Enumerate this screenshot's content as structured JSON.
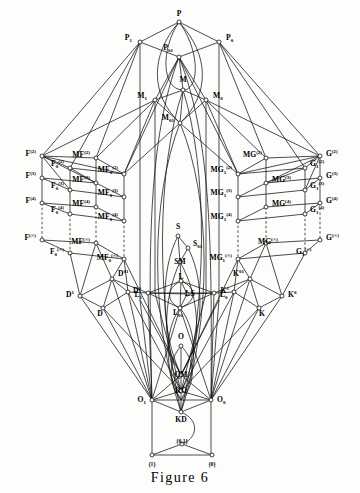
{
  "figure": {
    "caption": "Figure 6",
    "type": "lattice-hasse-diagram",
    "title": "Figure 6"
  },
  "colors": {
    "ink": "#111111",
    "paper": "#fdfdfc"
  },
  "nodes": {
    "top": [
      {
        "id": "P",
        "label": "P",
        "sub": "",
        "sup": "",
        "x": 179,
        "y": 22,
        "lx": 179,
        "ly": 16,
        "anchor": "middle"
      },
      {
        "id": "P1",
        "label": "P",
        "sub": "1",
        "sup": "",
        "x": 140,
        "y": 42,
        "lx": 132,
        "ly": 40,
        "anchor": "end"
      },
      {
        "id": "P0",
        "label": "P",
        "sub": "0",
        "sup": "",
        "x": 219,
        "y": 42,
        "lx": 226,
        "ly": 40,
        "anchor": "start"
      },
      {
        "id": "P01",
        "label": "P",
        "sub": "01",
        "sup": "",
        "x": 179,
        "y": 57,
        "lx": 173,
        "ly": 50,
        "anchor": "end"
      },
      {
        "id": "M",
        "label": "M",
        "sub": "",
        "sup": "",
        "x": 183,
        "y": 90,
        "lx": 183,
        "ly": 82,
        "anchor": "middle"
      },
      {
        "id": "M1",
        "label": "M",
        "sub": "1",
        "sup": "",
        "x": 155,
        "y": 100,
        "lx": 147,
        "ly": 98,
        "anchor": "end"
      },
      {
        "id": "M0",
        "label": "M",
        "sub": "0",
        "sup": "",
        "x": 206,
        "y": 100,
        "lx": 213,
        "ly": 98,
        "anchor": "start"
      },
      {
        "id": "M01",
        "label": "M",
        "sub": "01",
        "sup": "",
        "x": 180,
        "y": 123,
        "lx": 174,
        "ly": 120,
        "anchor": "end"
      }
    ],
    "left_F": [
      {
        "id": "F2",
        "label": "F",
        "sub": "",
        "sup": "(2)",
        "x": 42,
        "y": 156,
        "lx": 36,
        "ly": 156,
        "anchor": "end"
      },
      {
        "id": "F3",
        "label": "F",
        "sub": "",
        "sup": "(3)",
        "x": 42,
        "y": 178,
        "lx": 36,
        "ly": 178,
        "anchor": "end"
      },
      {
        "id": "F4",
        "label": "F",
        "sub": "",
        "sup": "(4)",
        "x": 42,
        "y": 203,
        "lx": 36,
        "ly": 203,
        "anchor": "end"
      },
      {
        "id": "Finf",
        "label": "F",
        "sub": "",
        "sup": "(∞)",
        "x": 42,
        "y": 240,
        "lx": 36,
        "ly": 240,
        "anchor": "end"
      },
      {
        "id": "F02",
        "label": "F",
        "sub": "0",
        "sup": "(2)",
        "x": 70,
        "y": 168,
        "lx": 64,
        "ly": 166,
        "anchor": "end"
      },
      {
        "id": "F03",
        "label": "F",
        "sub": "0",
        "sup": "(3)",
        "x": 70,
        "y": 190,
        "lx": 64,
        "ly": 188,
        "anchor": "end"
      },
      {
        "id": "F04",
        "label": "F",
        "sub": "0",
        "sup": "(4)",
        "x": 70,
        "y": 214,
        "lx": 64,
        "ly": 212,
        "anchor": "end"
      },
      {
        "id": "F0inf",
        "label": "F",
        "sub": "0",
        "sup": "(∞)",
        "x": 70,
        "y": 253,
        "lx": 64,
        "ly": 254,
        "anchor": "end"
      }
    ],
    "left_MF": [
      {
        "id": "MF2",
        "label": "MF",
        "sub": "",
        "sup": "(2)",
        "x": 96,
        "y": 158,
        "lx": 90,
        "ly": 157,
        "anchor": "end"
      },
      {
        "id": "MF3",
        "label": "MF",
        "sub": "",
        "sup": "(3)",
        "x": 96,
        "y": 183,
        "lx": 90,
        "ly": 182,
        "anchor": "end"
      },
      {
        "id": "MF4",
        "label": "MF",
        "sub": "",
        "sup": "(4)",
        "x": 96,
        "y": 207,
        "lx": 90,
        "ly": 206,
        "anchor": "end"
      },
      {
        "id": "MFinf",
        "label": "MF",
        "sub": "",
        "sup": "(∞)",
        "x": 96,
        "y": 243,
        "lx": 90,
        "ly": 244,
        "anchor": "end"
      },
      {
        "id": "MF02",
        "label": "MF",
        "sub": "0",
        "sup": "(2)",
        "x": 124,
        "y": 174,
        "lx": 118,
        "ly": 172,
        "anchor": "end"
      },
      {
        "id": "MF03",
        "label": "MF",
        "sub": "0",
        "sup": "(3)",
        "x": 124,
        "y": 197,
        "lx": 118,
        "ly": 195,
        "anchor": "end"
      },
      {
        "id": "MF04",
        "label": "MF",
        "sub": "0",
        "sup": "(4)",
        "x": 124,
        "y": 221,
        "lx": 118,
        "ly": 219,
        "anchor": "end"
      },
      {
        "id": "MF0inf",
        "label": "MF",
        "sub": "0",
        "sup": "(∞)",
        "x": 124,
        "y": 259,
        "lx": 118,
        "ly": 260,
        "anchor": "end"
      }
    ],
    "right_G": [
      {
        "id": "G2",
        "label": "G",
        "sub": "",
        "sup": "(2)",
        "x": 320,
        "y": 156,
        "lx": 326,
        "ly": 156,
        "anchor": "start"
      },
      {
        "id": "G3",
        "label": "G",
        "sub": "",
        "sup": "(3)",
        "x": 320,
        "y": 178,
        "lx": 326,
        "ly": 178,
        "anchor": "start"
      },
      {
        "id": "G4",
        "label": "G",
        "sub": "",
        "sup": "(4)",
        "x": 320,
        "y": 203,
        "lx": 326,
        "ly": 203,
        "anchor": "start"
      },
      {
        "id": "Ginf",
        "label": "G",
        "sub": "",
        "sup": "(∞)",
        "x": 320,
        "y": 240,
        "lx": 326,
        "ly": 240,
        "anchor": "start"
      },
      {
        "id": "G12",
        "label": "G",
        "sub": "1",
        "sup": "(2)",
        "x": 305,
        "y": 168,
        "lx": 310,
        "ly": 166,
        "anchor": "start"
      },
      {
        "id": "G13",
        "label": "G",
        "sub": "1",
        "sup": "(3)",
        "x": 305,
        "y": 190,
        "lx": 310,
        "ly": 188,
        "anchor": "start"
      },
      {
        "id": "G14",
        "label": "G",
        "sub": "1",
        "sup": "(4)",
        "x": 305,
        "y": 214,
        "lx": 310,
        "ly": 212,
        "anchor": "start"
      },
      {
        "id": "G1inf",
        "label": "G",
        "sub": "1",
        "sup": "(∞)",
        "x": 305,
        "y": 253,
        "lx": 296,
        "ly": 254,
        "anchor": "start"
      }
    ],
    "right_MG": [
      {
        "id": "MG2",
        "label": "MG",
        "sub": "",
        "sup": "(2)",
        "x": 266,
        "y": 158,
        "lx": 262,
        "ly": 157,
        "anchor": "end"
      },
      {
        "id": "MG3",
        "label": "MG",
        "sub": "",
        "sup": "(3)",
        "x": 266,
        "y": 183,
        "lx": 272,
        "ly": 182,
        "anchor": "start"
      },
      {
        "id": "MG4",
        "label": "MG",
        "sub": "",
        "sup": "(4)",
        "x": 266,
        "y": 207,
        "lx": 272,
        "ly": 206,
        "anchor": "start"
      },
      {
        "id": "MGinf",
        "label": "MG",
        "sub": "",
        "sup": "(∞)",
        "x": 266,
        "y": 243,
        "lx": 258,
        "ly": 244,
        "anchor": "start"
      },
      {
        "id": "MG12",
        "label": "MG",
        "sub": "1",
        "sup": "(2)",
        "x": 238,
        "y": 174,
        "lx": 232,
        "ly": 172,
        "anchor": "end"
      },
      {
        "id": "MG13",
        "label": "MG",
        "sub": "1",
        "sup": "(3)",
        "x": 238,
        "y": 197,
        "lx": 232,
        "ly": 195,
        "anchor": "end"
      },
      {
        "id": "MG14",
        "label": "MG",
        "sub": "1",
        "sup": "(4)",
        "x": 238,
        "y": 221,
        "lx": 232,
        "ly": 219,
        "anchor": "end"
      },
      {
        "id": "MG1inf",
        "label": "MG",
        "sub": "1",
        "sup": "(∞)",
        "x": 238,
        "y": 259,
        "lx": 232,
        "ly": 260,
        "anchor": "end"
      }
    ],
    "center": [
      {
        "id": "S",
        "label": "S",
        "sub": "",
        "sup": "",
        "x": 178,
        "y": 236,
        "lx": 178,
        "ly": 229,
        "anchor": "middle"
      },
      {
        "id": "S01",
        "label": "S",
        "sub": "01",
        "sup": "",
        "x": 188,
        "y": 248,
        "lx": 193,
        "ly": 246,
        "anchor": "start"
      },
      {
        "id": "SM",
        "label": "SM",
        "sub": "",
        "sup": "",
        "x": 180,
        "y": 262,
        "lx": 180,
        "ly": 264,
        "anchor": "middle"
      },
      {
        "id": "L",
        "label": "L",
        "sub": "",
        "sup": "",
        "x": 181,
        "y": 281,
        "lx": 181,
        "ly": 279,
        "anchor": "middle"
      },
      {
        "id": "LS",
        "label": "LS",
        "sub": "",
        "sup": "",
        "x": 187,
        "y": 294,
        "lx": 190,
        "ly": 296,
        "anchor": "middle"
      },
      {
        "id": "L1",
        "label": "L",
        "sub": "1",
        "sup": "",
        "x": 148,
        "y": 293,
        "lx": 142,
        "ly": 297,
        "anchor": "end"
      },
      {
        "id": "L0",
        "label": "L",
        "sub": "0",
        "sup": "",
        "x": 214,
        "y": 293,
        "lx": 220,
        "ly": 297,
        "anchor": "start"
      },
      {
        "id": "L01",
        "label": "L",
        "sub": "01",
        "sup": "",
        "x": 180,
        "y": 308,
        "lx": 178,
        "ly": 315,
        "anchor": "middle"
      },
      {
        "id": "O",
        "label": "O",
        "sub": "",
        "sup": "",
        "x": 181,
        "y": 346,
        "lx": 181,
        "ly": 339,
        "anchor": "middle"
      },
      {
        "id": "QM",
        "label": "QM",
        "sub": "",
        "sup": "",
        "x": 181,
        "y": 375,
        "lx": 181,
        "ly": 377,
        "anchor": "middle"
      },
      {
        "id": "KO",
        "label": "KO",
        "sub": "",
        "sup": "",
        "x": 181,
        "y": 391,
        "lx": 181,
        "ly": 393,
        "anchor": "middle"
      },
      {
        "id": "O1",
        "label": "O",
        "sub": "1",
        "sup": "",
        "x": 152,
        "y": 400,
        "lx": 146,
        "ly": 402,
        "anchor": "end"
      },
      {
        "id": "O0",
        "label": "O",
        "sub": "0",
        "sup": "",
        "x": 211,
        "y": 400,
        "lx": 217,
        "ly": 402,
        "anchor": "start"
      },
      {
        "id": "KD",
        "label": "KD",
        "sub": "",
        "sup": "",
        "x": 181,
        "y": 412,
        "lx": 181,
        "ly": 422,
        "anchor": "middle"
      }
    ],
    "lower_left_D": [
      {
        "id": "D01",
        "label": "D",
        "sub": "",
        "sup": "01",
        "x": 112,
        "y": 279,
        "lx": 118,
        "ly": 276,
        "anchor": "start"
      },
      {
        "id": "D1",
        "label": "D",
        "sub": "",
        "sup": "1",
        "x": 80,
        "y": 296,
        "lx": 74,
        "ly": 297,
        "anchor": "end"
      },
      {
        "id": "D0",
        "label": "D",
        "sub": "",
        "sup": "0",
        "x": 128,
        "y": 292,
        "lx": 133,
        "ly": 293,
        "anchor": "start"
      },
      {
        "id": "D",
        "label": "D",
        "sub": "",
        "sup": "",
        "x": 103,
        "y": 308,
        "lx": 100,
        "ly": 316,
        "anchor": "middle"
      }
    ],
    "lower_right_K": [
      {
        "id": "K01",
        "label": "K",
        "sub": "",
        "sup": "01",
        "x": 250,
        "y": 279,
        "lx": 244,
        "ly": 276,
        "anchor": "end"
      },
      {
        "id": "K1",
        "label": "K",
        "sub": "",
        "sup": "1",
        "x": 234,
        "y": 292,
        "lx": 229,
        "ly": 293,
        "anchor": "end"
      },
      {
        "id": "K0",
        "label": "K",
        "sub": "",
        "sup": "0",
        "x": 282,
        "y": 296,
        "lx": 288,
        "ly": 297,
        "anchor": "start"
      },
      {
        "id": "K",
        "label": "K",
        "sub": "",
        "sup": "",
        "x": 259,
        "y": 308,
        "lx": 262,
        "ly": 316,
        "anchor": "middle"
      }
    ],
    "bottom": [
      {
        "id": "T01",
        "label": "{0,1}",
        "sub": "",
        "sup": "",
        "x": 182,
        "y": 444,
        "lx": 182,
        "ly": 443,
        "anchor": "middle"
      },
      {
        "id": "T1",
        "label": "{1}",
        "sub": "",
        "sup": "",
        "x": 152,
        "y": 455,
        "lx": 152,
        "ly": 466,
        "anchor": "middle"
      },
      {
        "id": "T0",
        "label": "{0}",
        "sub": "",
        "sup": "",
        "x": 212,
        "y": 455,
        "lx": 212,
        "ly": 466,
        "anchor": "middle"
      }
    ]
  },
  "legend": {
    "node_count_note": "",
    "figure_label": "Figure 6"
  }
}
